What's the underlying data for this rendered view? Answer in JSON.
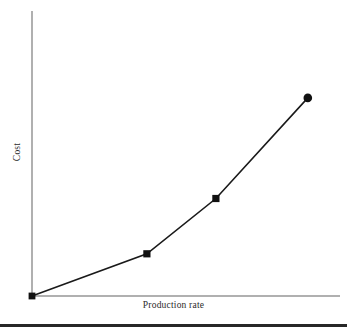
{
  "chart_data": {
    "type": "line",
    "title": "",
    "subtitle": "",
    "xlabel": "Production rate",
    "ylabel": "Cost",
    "x": [
      0,
      1,
      1.6,
      2.4
    ],
    "values": [
      0,
      0.148,
      0.342,
      0.695
    ],
    "series": [
      {
        "name": "Cost curve",
        "x": [
          0,
          1,
          1.6,
          2.4
        ],
        "values": [
          0,
          0.148,
          0.342,
          0.695
        ],
        "color": "#1a1a1a",
        "marker": "square",
        "markers": [
          "square",
          "square",
          "square",
          "circle"
        ]
      }
    ],
    "xlim": [
      0,
      2.68
    ],
    "ylim": [
      0,
      1.0
    ],
    "grid": false,
    "legend": false,
    "xticks": [],
    "yticks": [],
    "xticklabels": [],
    "yticklabels": [],
    "annotations": []
  },
  "figure": {
    "axis_color": "#b0b0b0",
    "line_color": "#1a1a1a",
    "marker_color": "#111111",
    "label_color": "#2b2b2b",
    "background": "#ffffff",
    "rule_color": "#272727"
  },
  "labels": {
    "x_axis": "Production rate",
    "y_axis": "Cost"
  }
}
